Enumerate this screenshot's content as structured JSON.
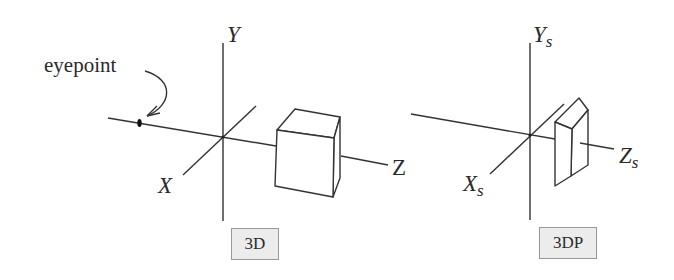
{
  "diagram": {
    "left_panel": {
      "tag": "3D",
      "axes": {
        "y": "Y",
        "x": "X",
        "z": "Z"
      },
      "annotation": "eyepoint",
      "object": "cube"
    },
    "right_panel": {
      "tag": "3DP",
      "axes": {
        "y": "Y",
        "y_sub": "s",
        "x": "X",
        "x_sub": "s",
        "z": "Z",
        "z_sub": "s"
      },
      "object": "perspective-projected-cube"
    },
    "colors": {
      "line": "#333333",
      "tag_bg": "#ececec",
      "tag_border": "#999999"
    }
  }
}
